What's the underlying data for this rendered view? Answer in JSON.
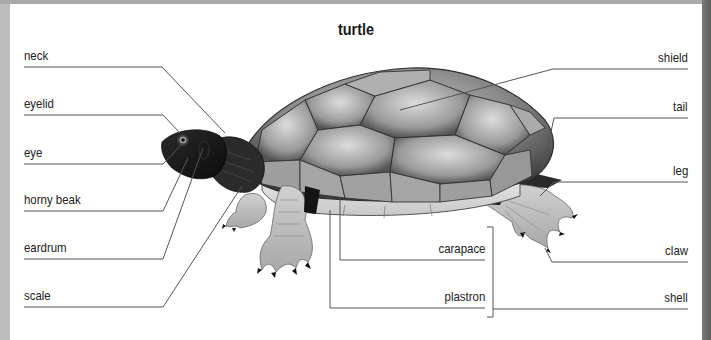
{
  "title": "turtle",
  "colors": {
    "panel_bg": "#ffffff",
    "frame_gray": "#bdbdbd",
    "leader_line": "#555555",
    "shell_dark": "#3a3a3a",
    "shell_light": "#b8b8b8",
    "skin_dark": "#1e1e1e",
    "leg_light": "#c4c4c4",
    "plastron": "#d6d6d6"
  },
  "labels": {
    "left": [
      {
        "id": "neck",
        "text": "neck"
      },
      {
        "id": "eyelid",
        "text": "eyelid"
      },
      {
        "id": "eye",
        "text": "eye"
      },
      {
        "id": "horny_beak",
        "text": "horny beak"
      },
      {
        "id": "eardrum",
        "text": "eardrum"
      },
      {
        "id": "scale",
        "text": "scale"
      }
    ],
    "center": [
      {
        "id": "carapace",
        "text": "carapace"
      },
      {
        "id": "plastron",
        "text": "plastron"
      }
    ],
    "right": [
      {
        "id": "shield",
        "text": "shield"
      },
      {
        "id": "tail",
        "text": "tail"
      },
      {
        "id": "leg",
        "text": "leg"
      },
      {
        "id": "claw",
        "text": "claw"
      },
      {
        "id": "shell",
        "text": "shell"
      }
    ]
  }
}
